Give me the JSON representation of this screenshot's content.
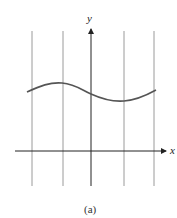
{
  "figure": {
    "caption": "(a)",
    "x_axis_label": "x",
    "y_axis_label": "y",
    "colors": {
      "axis": "#222222",
      "grid_line": "#9a9a9a",
      "curve": "#555555"
    }
  },
  "vertical_lines_x": [
    32,
    63,
    124,
    154
  ],
  "curve": {
    "description": "sinusoidal wave above x-axis, peak near second vertical line, trough near fourth vertical line",
    "points": [
      [
        27,
        92
      ],
      [
        62,
        83
      ],
      [
        91,
        93
      ],
      [
        124,
        101
      ],
      [
        156,
        90
      ]
    ]
  }
}
